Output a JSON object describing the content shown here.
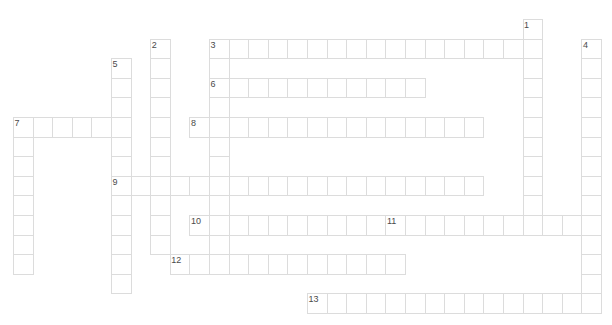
{
  "puzzle": {
    "type": "crossword-grid",
    "title": "",
    "width": 612,
    "height": 325,
    "cell_size": 19.6,
    "origin_x": 13,
    "origin_y": 19,
    "cell_border_color": "#dcdcdc",
    "cell_fill_color": "#ffffff",
    "number_color": "#4a4a4a",
    "background": "#ffffff",
    "entries": [
      {
        "number": "1",
        "direction": "down",
        "col": 26,
        "row": 0,
        "length": 11
      },
      {
        "number": "2",
        "direction": "down",
        "col": 7,
        "row": 1,
        "length": 11
      },
      {
        "number": "3",
        "direction": "across",
        "col": 10,
        "row": 1,
        "length": 16
      },
      {
        "number": "3",
        "direction": "down",
        "col": 10,
        "row": 1,
        "length": 12
      },
      {
        "number": "4",
        "direction": "down",
        "col": 29,
        "row": 1,
        "length": 13
      },
      {
        "number": "5",
        "direction": "down",
        "col": 5,
        "row": 2,
        "length": 12
      },
      {
        "number": "6",
        "direction": "across",
        "col": 10,
        "row": 3,
        "length": 11
      },
      {
        "number": "7",
        "direction": "across",
        "col": 0,
        "row": 5,
        "length": 6
      },
      {
        "number": "7",
        "direction": "down",
        "col": 0,
        "row": 5,
        "length": 8
      },
      {
        "number": "8",
        "direction": "across",
        "col": 9,
        "row": 5,
        "length": 15
      },
      {
        "number": "9",
        "direction": "across",
        "col": 5,
        "row": 8,
        "length": 19
      },
      {
        "number": "10",
        "direction": "across",
        "col": 9,
        "row": 10,
        "length": 10
      },
      {
        "number": "11",
        "direction": "across",
        "col": 19,
        "row": 10,
        "length": 10
      },
      {
        "number": "12",
        "direction": "across",
        "col": 8,
        "row": 12,
        "length": 12
      },
      {
        "number": "13",
        "direction": "across",
        "col": 15,
        "row": 14,
        "length": 15
      }
    ],
    "numbered_labels": [
      {
        "label": "1",
        "col": 26,
        "row": 0
      },
      {
        "label": "2",
        "col": 7,
        "row": 1
      },
      {
        "label": "3",
        "col": 10,
        "row": 1
      },
      {
        "label": "4",
        "col": 29,
        "row": 1
      },
      {
        "label": "5",
        "col": 5,
        "row": 2
      },
      {
        "label": "6",
        "col": 10,
        "row": 3
      },
      {
        "label": "7",
        "col": 0,
        "row": 5
      },
      {
        "label": "8",
        "col": 9,
        "row": 5
      },
      {
        "label": "9",
        "col": 5,
        "row": 8
      },
      {
        "label": "10",
        "col": 9,
        "row": 10
      },
      {
        "label": "11",
        "col": 19,
        "row": 10
      },
      {
        "label": "12",
        "col": 8,
        "row": 12
      },
      {
        "label": "13",
        "col": 15,
        "row": 14
      }
    ]
  }
}
